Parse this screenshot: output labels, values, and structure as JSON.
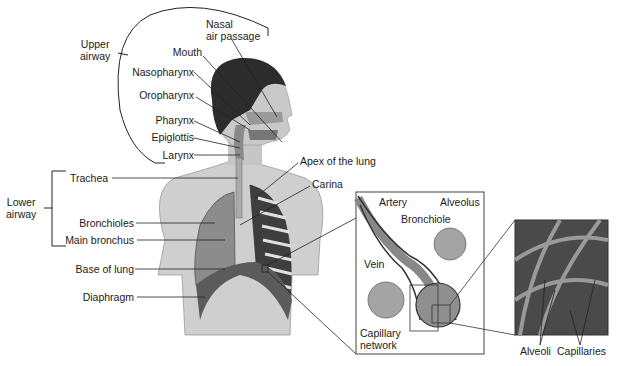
{
  "diagram": {
    "groups": {
      "upper_airway": [
        "Upper",
        "airway"
      ],
      "lower_airway": [
        "Lower",
        "airway"
      ]
    },
    "labels": {
      "nasal_1": "Nasal",
      "nasal_2": "air passage",
      "mouth": "Mouth",
      "nasopharynx": "Nasopharynx",
      "oropharynx": "Oropharynx",
      "pharynx": "Pharynx",
      "epiglottis": "Epiglottis",
      "larynx": "Larynx",
      "trachea": "Trachea",
      "bronchioles": "Bronchioles",
      "main_bronchus": "Main bronchus",
      "base_of_lung": "Base of lung",
      "diaphragm": "Diaphragm",
      "apex": "Apex of the lung",
      "carina": "Carina"
    },
    "inset_1": {
      "artery": "Artery",
      "bronchiole": "Bronchiole",
      "alveolus": "Alveolus",
      "vein": "Vein",
      "capillary_1": "Capillary",
      "capillary_2": "network"
    },
    "inset_2": {
      "alveoli": "Alveoli",
      "capillaries": "Capillaries"
    },
    "colors": {
      "skin": "#c9c9c9",
      "hair": "#2a2a2a",
      "lung": "#8a8a8a",
      "diaphragm": "#5e5e5e",
      "line": "#222222"
    }
  }
}
